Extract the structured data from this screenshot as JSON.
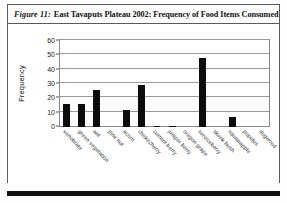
{
  "figure": {
    "number_label": "Figure 11:",
    "caption": "East Tavaputs Plateau 2002: Frequency of Food Items Consumed"
  },
  "chart_data": {
    "type": "bar",
    "title": "East Tavaputs Plateau 2002: Frequency of Food Items Consumed",
    "xlabel": "",
    "ylabel": "Frequency",
    "ylim": [
      0,
      60
    ],
    "yticks": [
      0,
      10,
      20,
      30,
      40,
      50,
      60
    ],
    "grid": true,
    "legend": false,
    "categories": [
      "vertebrate",
      "green vegetation",
      "ant",
      "pine nut",
      "acorn",
      "chokecherry",
      "currant berry",
      "juniper berry",
      "oregon grape",
      "serviceberry",
      "skunk bush",
      "squawapple",
      "populus",
      "dogwood"
    ],
    "values": [
      16,
      16,
      26,
      0,
      12,
      29,
      1,
      1,
      0,
      48,
      0,
      7,
      0,
      0
    ],
    "bar_color": "#0c0c0c"
  },
  "colors": {
    "bar": "#0c0c0c",
    "grid": "#9a9a9a",
    "frame": "#5a5a5a",
    "text": "#111111"
  }
}
